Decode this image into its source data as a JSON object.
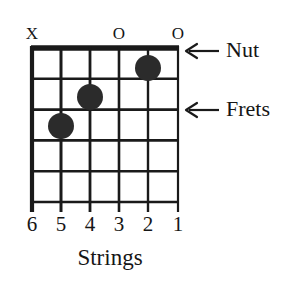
{
  "diagram": {
    "type": "guitar-chord-diagram",
    "ink_color": "#1a1a1a",
    "background_color": "#ffffff",
    "fretboard": {
      "string_count": 6,
      "fret_count": 5,
      "left": 32,
      "right": 178,
      "nut_y": 48,
      "bottom_y": 202,
      "string_overhang_y": 212,
      "string_spacing": 29.2,
      "fret_spacing": 30.8,
      "nut_thickness": 5,
      "line_thickness": 2.6,
      "low_e_thickness": 4
    },
    "open_marks": [
      {
        "label": "X",
        "string": 6,
        "x": 32,
        "y": 33,
        "meaning": "muted"
      },
      {
        "label": "O",
        "string": 3,
        "x": 119,
        "y": 33,
        "meaning": "open"
      },
      {
        "label": "O",
        "string": 1,
        "x": 178,
        "y": 33,
        "meaning": "open"
      }
    ],
    "finger_dots": [
      {
        "string": 2,
        "fret": 1,
        "cx": 148,
        "cy": 68,
        "r": 13
      },
      {
        "string": 4,
        "fret": 2,
        "cx": 90,
        "cy": 97,
        "r": 13
      },
      {
        "string": 5,
        "fret": 3,
        "cx": 61,
        "cy": 126,
        "r": 13
      }
    ],
    "string_numbers": [
      {
        "label": "6",
        "x": 32
      },
      {
        "label": "5",
        "x": 61
      },
      {
        "label": "4",
        "x": 90
      },
      {
        "label": "3",
        "x": 119
      },
      {
        "label": "2",
        "x": 148
      },
      {
        "label": "1",
        "x": 178
      }
    ],
    "string_numbers_y": 222,
    "axis_caption": {
      "text": "Strings",
      "x": 110,
      "y": 252
    },
    "callouts": [
      {
        "text": "Nut",
        "arrow_tip_x": 186,
        "arrow_tail_x": 219,
        "arrow_y": 51,
        "text_x": 226,
        "text_y": 40
      },
      {
        "text": "Frets",
        "arrow_tip_x": 186,
        "arrow_tail_x": 219,
        "arrow_y": 110,
        "text_x": 226,
        "text_y": 99
      }
    ]
  }
}
